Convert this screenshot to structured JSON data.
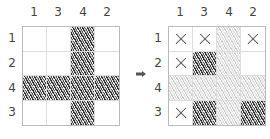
{
  "column_clues": [
    "1",
    "3",
    "4",
    "2"
  ],
  "row_clues": [
    "1",
    "2",
    "4",
    "3"
  ],
  "before_grid": {
    "cells": [
      [
        "empty",
        "empty",
        "dark",
        "empty"
      ],
      [
        "empty",
        "empty",
        "dark",
        "empty"
      ],
      [
        "dark",
        "dark",
        "dark",
        "dark"
      ],
      [
        "empty",
        "empty",
        "dark",
        "empty"
      ]
    ]
  },
  "after_grid": {
    "cells": [
      [
        "x",
        "x",
        "light",
        "x"
      ],
      [
        "x",
        "dark",
        "light",
        "empty"
      ],
      [
        "light",
        "light",
        "light",
        "light"
      ],
      [
        "x",
        "dark",
        "light",
        "dark"
      ]
    ]
  },
  "arrow": {
    "icon": "right-arrow-icon",
    "color": "#555555"
  },
  "colors": {
    "shade_dark": "#333333",
    "shade_light": "#cccccc",
    "grid_line": "#bbbbbb"
  }
}
